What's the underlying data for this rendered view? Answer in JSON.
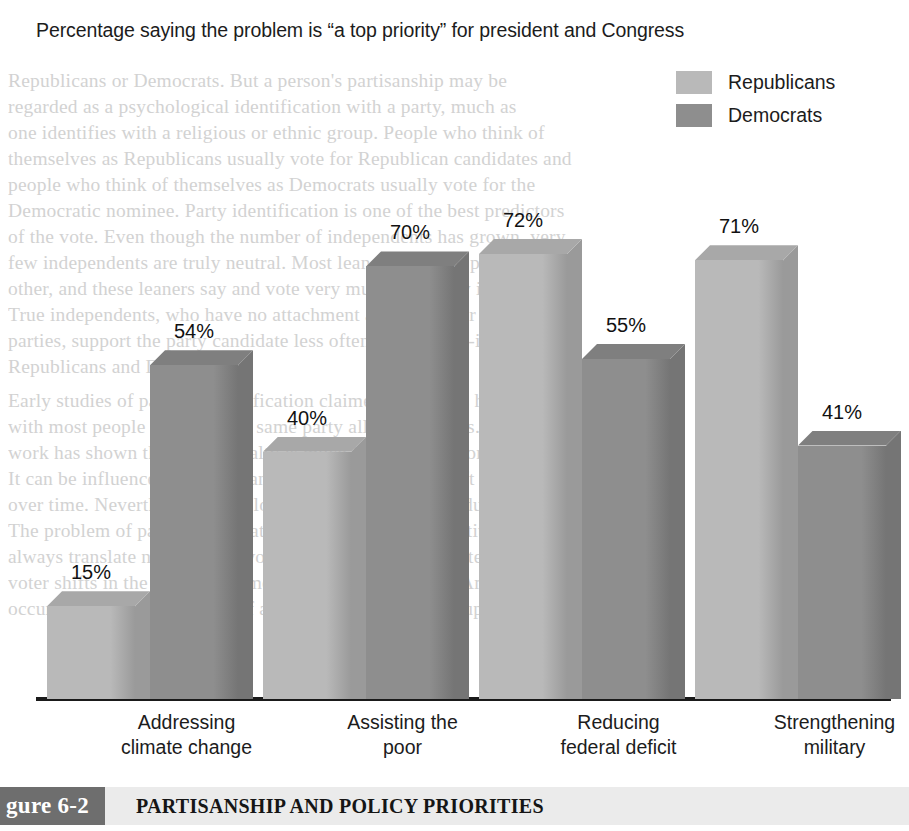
{
  "chart_data": {
    "type": "bar",
    "title": "Percentage saying the problem is “a top priority” for president and Congress",
    "xlabel": "",
    "ylabel": "",
    "ylim": [
      0,
      80
    ],
    "grid": false,
    "legend_position": "top-right",
    "value_suffix": "%",
    "categories": [
      "Addressing climate change",
      "Assisting the poor",
      "Reducing federal deficit",
      "Strengthening military"
    ],
    "category_lines": [
      [
        "Addressing",
        "climate change"
      ],
      [
        "Assisting the",
        "poor"
      ],
      [
        "Reducing",
        "federal deficit"
      ],
      [
        "Strengthening",
        "military"
      ]
    ],
    "series": [
      {
        "name": "Republicans",
        "color": "#b9b9b9",
        "side_color": "#9a9a9a",
        "top_color": "#a8a8a8",
        "values": [
          15,
          40,
          72,
          71
        ],
        "labels": [
          "15%",
          "40%",
          "72%",
          "71%"
        ]
      },
      {
        "name": "Democrats",
        "color": "#8e8e8e",
        "side_color": "#757575",
        "top_color": "#7f7f7f",
        "values": [
          54,
          70,
          55,
          41
        ],
        "labels": [
          "54%",
          "70%",
          "55%",
          "41%"
        ]
      }
    ]
  },
  "legend": {
    "items": [
      {
        "label": "Republicans",
        "color": "#b9b9b9"
      },
      {
        "label": "Democrats",
        "color": "#8e8e8e"
      }
    ]
  },
  "caption": {
    "tag": "gure 6-2",
    "title": "PARTISANSHIP AND POLICY PRIORITIES"
  },
  "background_text": {
    "lines": [
      "Republicans or Democrats. But a person's partisanship may be",
      "regarded as a psychological identification with a party, much as",
      "one identifies with a religious or ethnic group. People who think of",
      "themselves as Republicans usually vote for Republican candidates and",
      "people who think of themselves as Democrats usually vote for the",
      "Democratic nominee. Party identification is one of the best predictors",
      "of the vote. Even though the number of independents has grown, very",
      "few independents are truly neutral. Most lean toward one party or the",
      "other, and these leaners say and vote very much like party identifiers.",
      "True independents, who have no attachment at all to either of the major",
      "parties, support the party candidate less often than do self-identified",
      "Republicans and Democrats.",
      "Early studies of partisan identification claimed that it was highly stable,",
      "with most people retaining the same party all of their lives. Subsequent",
      "work has shown that party loyalty is much less firm than originally believed.",
      "It can be influenced by issues and candidates and can shift on the move",
      "over time. Nevertheless, party loyalty remains relatively durable.",
      "The problem of party identification is that a person's identity does not",
      "always translate neatly into a vote for that party's candidates. Massive",
      "voter shifts in the party attachments of large numbers of Americans have",
      "occurred only in the context of a major national crisis or upheaval."
    ],
    "positions": [
      70,
      96,
      122,
      148,
      174,
      200,
      226,
      252,
      278,
      304,
      330,
      356,
      390,
      416,
      442,
      468,
      494,
      520,
      546,
      572,
      598
    ]
  }
}
